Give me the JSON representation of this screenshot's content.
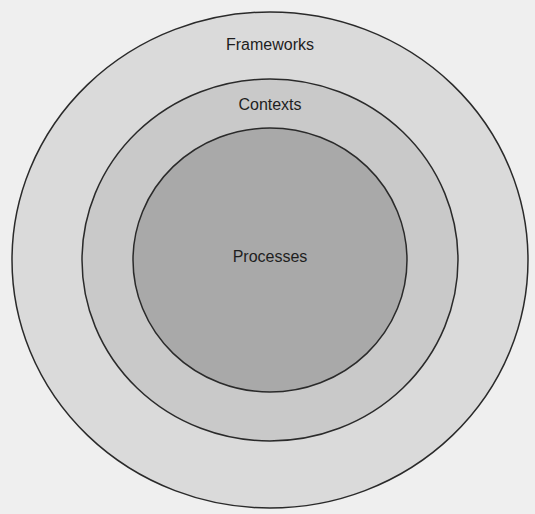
{
  "diagram": {
    "type": "nested-circles",
    "layers": [
      {
        "id": "frameworks",
        "label": "Frameworks",
        "fill": "#dadada",
        "stroke": "#2a2a2a",
        "cx": 270,
        "cy": 260,
        "rx": 258,
        "ry": 248,
        "label_x": 170,
        "label_y": 36
      },
      {
        "id": "contexts",
        "label": "Contexts",
        "fill": "#c9c9c9",
        "stroke": "#2a2a2a",
        "cx": 270,
        "cy": 260,
        "rx": 188,
        "ry": 181,
        "label_x": 170,
        "label_y": 96
      },
      {
        "id": "processes",
        "label": "Processes",
        "fill": "#a9a9a9",
        "stroke": "#2a2a2a",
        "cx": 270,
        "cy": 260,
        "rx": 137,
        "ry": 132,
        "label_x": 170,
        "label_y": 248
      }
    ],
    "background": "#efefef"
  }
}
